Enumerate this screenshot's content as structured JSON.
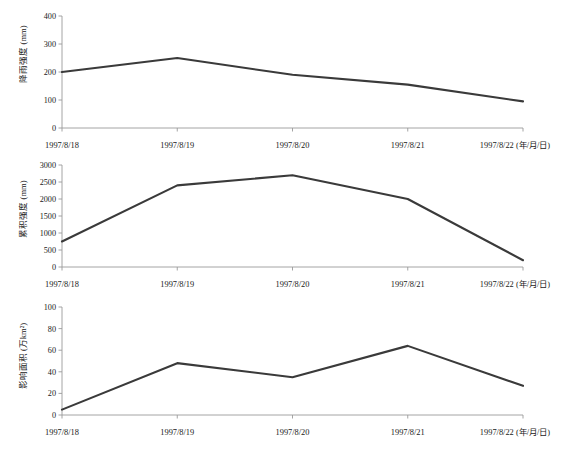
{
  "figure": {
    "background": "#ffffff",
    "line_color": "#3a3a3a",
    "axis_color": "#9a9a9a",
    "panel_count": 3
  },
  "x_axis": {
    "categories": [
      "1997/8/18",
      "1997/8/19",
      "1997/8/20",
      "1997/8/21",
      "1997/8/22"
    ],
    "unit_note": "(年/月/日)",
    "last_label_combined": "1997/8/22 (年/月/日)"
  },
  "panels": [
    {
      "id": "panel-rain-intensity",
      "ylabel": "降雨强度 (mm)",
      "yticks": [
        "0",
        "100",
        "200",
        "300",
        "400"
      ],
      "ytick_values": [
        0,
        100,
        200,
        300,
        400
      ],
      "ylim": [
        0,
        400
      ]
    },
    {
      "id": "panel-cumulative-intensity",
      "ylabel": "累积强度 (mm)",
      "yticks": [
        "0",
        "500",
        "1000",
        "1500",
        "2000",
        "2500",
        "3000"
      ],
      "ytick_values": [
        0,
        500,
        1000,
        1500,
        2000,
        2500,
        3000
      ],
      "ylim": [
        0,
        3000
      ]
    },
    {
      "id": "panel-affected-area",
      "ylabel": "影响面积 (万km²)",
      "yticks": [
        "0",
        "20",
        "40",
        "60",
        "80",
        "100"
      ],
      "ytick_values": [
        0,
        20,
        40,
        60,
        80,
        100
      ],
      "ylim": [
        0,
        100
      ]
    }
  ],
  "chart_data": [
    {
      "type": "line",
      "title": "",
      "xlabel": "(年/月/日)",
      "ylabel": "降雨强度 (mm)",
      "categories": [
        "1997/8/18",
        "1997/8/19",
        "1997/8/20",
        "1997/8/21",
        "1997/8/22"
      ],
      "values": [
        200,
        250,
        190,
        155,
        95
      ],
      "ylim": [
        0,
        400
      ],
      "yticks": [
        0,
        100,
        200,
        300,
        400
      ],
      "grid": false,
      "legend": "none",
      "line_color": "#3a3a3a"
    },
    {
      "type": "line",
      "title": "",
      "xlabel": "(年/月/日)",
      "ylabel": "累积强度 (mm)",
      "categories": [
        "1997/8/18",
        "1997/8/19",
        "1997/8/20",
        "1997/8/21",
        "1997/8/22"
      ],
      "values": [
        750,
        2400,
        2700,
        2000,
        200
      ],
      "ylim": [
        0,
        3000
      ],
      "yticks": [
        0,
        500,
        1000,
        1500,
        2000,
        2500,
        3000
      ],
      "grid": false,
      "legend": "none",
      "line_color": "#3a3a3a"
    },
    {
      "type": "line",
      "title": "",
      "xlabel": "(年/月/日)",
      "ylabel": "影响面积 (万km²)",
      "categories": [
        "1997/8/18",
        "1997/8/19",
        "1997/8/20",
        "1997/8/21",
        "1997/8/22"
      ],
      "values": [
        5,
        48,
        35,
        64,
        27
      ],
      "ylim": [
        0,
        100
      ],
      "yticks": [
        0,
        20,
        40,
        60,
        80,
        100
      ],
      "grid": false,
      "legend": "none",
      "line_color": "#3a3a3a"
    }
  ]
}
